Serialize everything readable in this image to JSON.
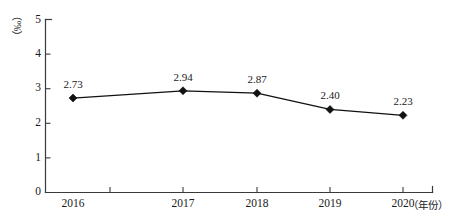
{
  "chart_data": {
    "type": "line",
    "title": "",
    "subtitle": "",
    "xlabel": "（年份）",
    "ylabel": "（‰）",
    "categories": [
      "2016",
      "2017",
      "2018",
      "2019",
      "2020"
    ],
    "values": [
      2.73,
      2.94,
      2.87,
      2.4,
      2.23
    ],
    "point_labels": [
      "2.73",
      "2.94",
      "2.87",
      "2.40",
      "2.23"
    ],
    "series": [
      {
        "name": "",
        "values": [
          2.73,
          2.94,
          2.87,
          2.4,
          2.23
        ]
      }
    ],
    "ylim": [
      0,
      5
    ],
    "ytick_labels": [
      "0",
      "1",
      "2",
      "3",
      "4",
      "5"
    ],
    "ytick_values": [
      0,
      1,
      2,
      3,
      4,
      5
    ],
    "grid": false,
    "legend": "none",
    "marker": "diamond",
    "colors": {
      "line": "#111111",
      "marker": "#111111",
      "axis": "#3a3a3a",
      "text": "#1a1a1a",
      "background": "#ffffff"
    }
  }
}
